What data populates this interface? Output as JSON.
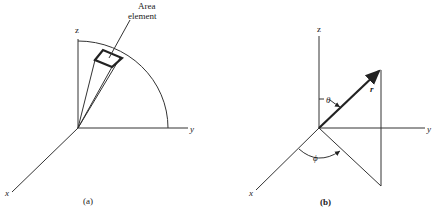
{
  "figure_a": {
    "caption": "(a)",
    "axis_labels": {
      "x": "x",
      "y": "y",
      "z": "z"
    },
    "annotation_line1": "Area",
    "annotation_line2": "element"
  },
  "figure_b": {
    "caption": "(b)",
    "axis_labels": {
      "x": "x",
      "y": "y",
      "z": "z"
    },
    "vector_label": "r",
    "polar_angle_label": "θ",
    "azimuth_angle_label": "ϕ"
  },
  "colors": {
    "ink": "#222222",
    "background": "#ffffff"
  }
}
